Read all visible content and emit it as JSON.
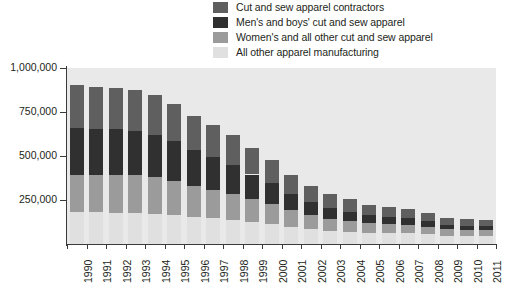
{
  "chart_data": {
    "type": "bar",
    "stacked": true,
    "title": "",
    "subtitle": "",
    "xlabel": "",
    "ylabel": "",
    "ylim": [
      0,
      1000000
    ],
    "ytick_values": [
      0,
      250000,
      500000,
      750000,
      1000000
    ],
    "ytick_labels": [
      "",
      "250,000",
      "500,000",
      "750,000",
      "1,000,000"
    ],
    "grid": false,
    "legend_position": "top",
    "categories": [
      "1990",
      "1991",
      "1992",
      "1993",
      "1994",
      "1995",
      "1996",
      "1997",
      "1998",
      "1999",
      "2000",
      "2001",
      "2002",
      "2003",
      "2004",
      "2005",
      "2006",
      "2007",
      "2008",
      "2009",
      "2010",
      "2011"
    ],
    "series": [
      {
        "name": "All other apparel manufacturing",
        "color": "#e0e0e0",
        "values": [
          183000,
          180000,
          178000,
          176000,
          173000,
          166000,
          155000,
          146000,
          136000,
          124000,
          112000,
          96000,
          85000,
          76000,
          70000,
          64000,
          62000,
          60000,
          55000,
          48000,
          46000,
          45000
        ]
      },
      {
        "name": "Women's and all other cut and sew apparel",
        "color": "#9b9b9b",
        "values": [
          210000,
          212000,
          215000,
          214000,
          207000,
          193000,
          176000,
          163000,
          151000,
          131000,
          114000,
          95000,
          80000,
          68000,
          61000,
          54000,
          50000,
          47000,
          42000,
          35000,
          33000,
          32000
        ]
      },
      {
        "name": "Men's and boys' cut and sew apparel",
        "color": "#303030",
        "values": [
          266000,
          262000,
          258000,
          252000,
          242000,
          225000,
          203000,
          186000,
          164000,
          140000,
          118000,
          94000,
          75000,
          62000,
          53000,
          45000,
          41000,
          38000,
          33000,
          27000,
          25000,
          24000
        ]
      },
      {
        "name": "Cut and sew apparel contractors",
        "color": "#5f5f5f",
        "values": [
          246000,
          240000,
          235000,
          231000,
          224000,
          211000,
          196000,
          182000,
          167000,
          150000,
          131000,
          109000,
          92000,
          78000,
          69000,
          60000,
          56000,
          52000,
          46000,
          38000,
          36000,
          35000
        ]
      }
    ],
    "totals": [
      905000,
      894000,
      886000,
      873000,
      846000,
      795000,
      730000,
      677000,
      618000,
      545000,
      475000,
      394000,
      332000,
      284000,
      253000,
      223000,
      209000,
      197000,
      176000,
      148000,
      140000,
      136000
    ]
  },
  "legend": {
    "items": [
      {
        "label": "Cut and sew apparel contractors",
        "color": "#5f5f5f"
      },
      {
        "label": "Men's and boys' cut and sew apparel",
        "color": "#303030"
      },
      {
        "label": "Women's and all other cut and sew apparel",
        "color": "#9b9b9b"
      },
      {
        "label": "All other apparel manufacturing",
        "color": "#e0e0e0"
      }
    ]
  },
  "axes": {
    "plot_background": "#e9e9e9",
    "axis_color": "#3a3a3a"
  }
}
